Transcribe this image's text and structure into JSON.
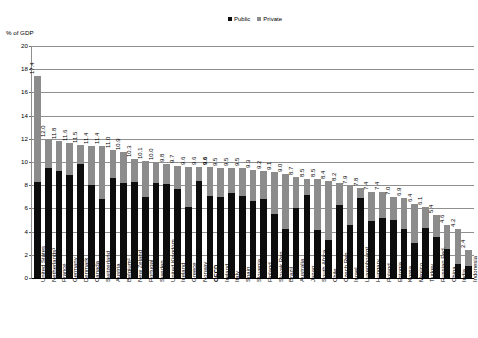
{
  "chart_data": {
    "type": "bar",
    "title": "",
    "subtitle": "",
    "xlabel": "",
    "ylabel": "% of GDP",
    "ylim": [
      0,
      20
    ],
    "ytick_step": 2,
    "yticks": [
      "0",
      "2",
      "4",
      "6",
      "8",
      "10",
      "12",
      "14",
      "16",
      "18",
      "20"
    ],
    "grid": true,
    "stacked": true,
    "legend_position": "top-right",
    "legend": [
      "Public",
      "Private"
    ],
    "highlight_category": "OECD",
    "categories": [
      "United States",
      "Netherlands¹",
      "France",
      "Germany",
      "Denmark",
      "Canada",
      "Switzerland",
      "Austria",
      "Belgium²",
      "New Zeland",
      "Portugal",
      "Sweden",
      "United Kingdom",
      "Iceland",
      "Greece",
      "Norway",
      "OECD",
      "Ireland",
      "Italy",
      "Spain",
      "Slovenia",
      "Finland",
      "Slovak Rep.",
      "Brazil",
      "Australia",
      "Japan",
      "South Africa",
      "Chile",
      "Czech Rep.",
      "Israel",
      "Luxembourg³",
      "Hungary",
      "Poland",
      "Estonia",
      "Korea",
      "Mexico",
      "Turkey",
      "Russian Fed.",
      "China",
      "India",
      "Indonesia"
    ],
    "totals": [
      17.4,
      12.0,
      11.8,
      11.6,
      11.5,
      11.4,
      11.4,
      11.0,
      10.9,
      10.3,
      10.1,
      10.0,
      9.8,
      9.7,
      9.6,
      9.6,
      9.6,
      9.5,
      9.5,
      9.5,
      9.3,
      9.2,
      9.1,
      9.0,
      8.7,
      8.5,
      8.5,
      8.4,
      8.2,
      7.9,
      7.8,
      7.4,
      7.4,
      7.0,
      6.9,
      6.4,
      6.1,
      5.4,
      4.6,
      4.2,
      2.4
    ],
    "series": [
      {
        "name": "Public",
        "color": "#0d0d0d",
        "values": [
          8.3,
          9.5,
          9.2,
          8.9,
          9.8,
          8.0,
          6.8,
          8.6,
          8.2,
          8.3,
          7.0,
          8.2,
          8.1,
          7.7,
          6.1,
          8.4,
          7.1,
          7.0,
          7.3,
          7.1,
          6.6,
          6.8,
          5.5,
          4.2,
          6.0,
          7.2,
          4.1,
          3.3,
          6.3,
          4.6,
          6.9,
          4.9,
          5.2,
          5.0,
          4.2,
          3.0,
          4.3,
          3.5,
          2.5,
          1.2,
          1.0
        ]
      },
      {
        "name": "Private",
        "color": "#8c8c8c",
        "values": [
          9.1,
          2.5,
          2.6,
          2.7,
          1.7,
          3.4,
          4.6,
          2.4,
          2.7,
          2.0,
          3.1,
          1.8,
          1.7,
          2.0,
          3.5,
          1.2,
          2.5,
          2.5,
          2.2,
          2.4,
          2.7,
          2.4,
          3.6,
          4.8,
          2.7,
          1.3,
          4.4,
          5.1,
          1.9,
          3.3,
          0.9,
          2.5,
          2.2,
          2.0,
          2.7,
          3.4,
          1.8,
          1.9,
          2.1,
          3.0,
          1.4
        ]
      }
    ],
    "value_labels": [
      "17.4",
      "12.0",
      "11.8",
      "11.6",
      "11.5",
      "11.4",
      "11.4",
      "11.0",
      "10.9",
      "10.3",
      "10.1",
      "10.0",
      "9.8",
      "9.7",
      "9.6",
      "9.6",
      "9.6",
      "9.5",
      "9.5",
      "9.5",
      "9.3",
      "9.2",
      "9.1",
      "9.0",
      "8.7",
      "8.5",
      "8.5",
      "8.4",
      "8.2",
      "7.9",
      "7.8",
      "7.4",
      "7.4",
      "7.0",
      "6.9",
      "6.4",
      "6.1",
      "5.4",
      "4.6",
      "4.2",
      "2.4"
    ]
  },
  "colors": {
    "public": "#0d0d0d",
    "private": "#8c8c8c",
    "grid": "#8f8f8f",
    "axis": "#000000",
    "background": "#ffffff"
  }
}
